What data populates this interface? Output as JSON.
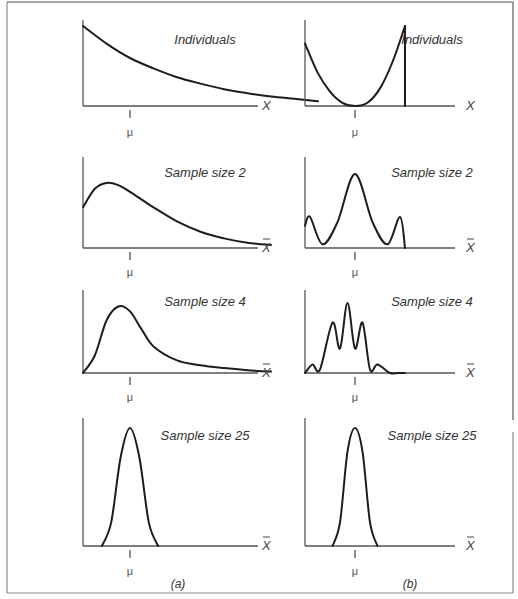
{
  "figure": {
    "columns": [
      {
        "id": "a",
        "caption": "(a)",
        "description": "Skewed (exponential-like) population",
        "panels": [
          {
            "title": "Individuals",
            "x_label": "X",
            "x_bar": false,
            "mu_label": "μ",
            "shape": "exponential decay"
          },
          {
            "title": "Sample size 2",
            "x_label": "X",
            "x_bar": true,
            "mu_label": "μ",
            "shape": "right-skewed, peak left of mean"
          },
          {
            "title": "Sample size 4",
            "x_label": "X",
            "x_bar": true,
            "mu_label": "μ",
            "shape": "right-skewed, peak near mean"
          },
          {
            "title": "Sample size 25",
            "x_label": "X",
            "x_bar": true,
            "mu_label": "μ",
            "shape": "approximately normal, centered at mean"
          }
        ]
      },
      {
        "id": "b",
        "caption": "(b)",
        "description": "U-shaped population",
        "panels": [
          {
            "title": "Individuals",
            "x_label": "X",
            "x_bar": false,
            "mu_label": "μ",
            "shape": "U-shaped, minimum at mean"
          },
          {
            "title": "Sample size 2",
            "x_label": "X",
            "x_bar": true,
            "mu_label": "μ",
            "shape": "trimodal, tallest peak at mean"
          },
          {
            "title": "Sample size 4",
            "x_label": "X",
            "x_bar": true,
            "mu_label": "μ",
            "shape": "five peaks, tallest at mean"
          },
          {
            "title": "Sample size 25",
            "x_label": "X",
            "x_bar": true,
            "mu_label": "μ",
            "shape": "approximately normal, centered at mean"
          }
        ]
      }
    ]
  },
  "chart_data": {
    "type": "line",
    "xlabel": "X / X̄",
    "ylabel": "",
    "note": "Schematic density curves; no numeric ticks shown. x expressed in relative units with mean μ marked.",
    "panels": [
      {
        "column": "a",
        "title": "Individuals",
        "x": [
          0,
          0.5,
          1,
          1.5,
          2,
          2.5,
          3,
          3.5,
          4,
          4.5,
          5
        ],
        "y": [
          1.0,
          0.78,
          0.6,
          0.47,
          0.36,
          0.28,
          0.21,
          0.16,
          0.12,
          0.09,
          0.06
        ],
        "mu": 1.0
      },
      {
        "column": "a",
        "title": "Sample size 2",
        "x": [
          0,
          0.25,
          0.5,
          0.75,
          1,
          1.5,
          2,
          2.5,
          3,
          3.5,
          4
        ],
        "y": [
          0.55,
          0.8,
          0.88,
          0.85,
          0.76,
          0.55,
          0.36,
          0.22,
          0.13,
          0.07,
          0.04
        ],
        "mu": 1.0
      },
      {
        "column": "a",
        "title": "Sample size 4",
        "x": [
          0,
          0.25,
          0.5,
          0.75,
          1,
          1.25,
          1.5,
          2,
          2.5,
          3,
          3.5,
          4
        ],
        "y": [
          0,
          0.25,
          0.75,
          0.95,
          0.88,
          0.62,
          0.38,
          0.18,
          0.11,
          0.07,
          0.04,
          0.02
        ],
        "mu": 1.0
      },
      {
        "column": "a",
        "title": "Sample size 25",
        "x": [
          0.4,
          0.6,
          0.8,
          1,
          1.2,
          1.4,
          1.6
        ],
        "y": [
          0,
          0.2,
          0.75,
          1.0,
          0.75,
          0.2,
          0
        ],
        "mu": 1.0
      },
      {
        "column": "b",
        "title": "Individuals",
        "x": [
          0,
          0.25,
          0.5,
          0.75,
          1,
          1.25,
          1.5,
          1.75,
          2
        ],
        "y": [
          0.78,
          0.42,
          0.18,
          0.04,
          0,
          0.04,
          0.22,
          0.55,
          1.0
        ],
        "mu": 1.0
      },
      {
        "column": "b",
        "title": "Sample size 2",
        "x": [
          0,
          0.1,
          0.35,
          0.65,
          1,
          1.35,
          1.65,
          1.9,
          2
        ],
        "y": [
          0.3,
          0.42,
          0.05,
          0.35,
          1.0,
          0.35,
          0.05,
          0.42,
          0
        ],
        "mu": 1.0
      },
      {
        "column": "b",
        "title": "Sample size 4",
        "x": [
          0,
          0.15,
          0.3,
          0.55,
          0.7,
          0.85,
          1,
          1.15,
          1.3,
          1.45,
          1.7,
          1.85,
          2
        ],
        "y": [
          0,
          0.12,
          0.05,
          0.72,
          0.35,
          1.0,
          0.35,
          0.72,
          0.05,
          0.12,
          0,
          0,
          0
        ],
        "mu": 1.0
      },
      {
        "column": "b",
        "title": "Sample size 25",
        "x": [
          0.55,
          0.7,
          0.85,
          1,
          1.15,
          1.3,
          1.45
        ],
        "y": [
          0,
          0.2,
          0.8,
          1.0,
          0.8,
          0.2,
          0
        ],
        "mu": 1.0
      }
    ]
  }
}
